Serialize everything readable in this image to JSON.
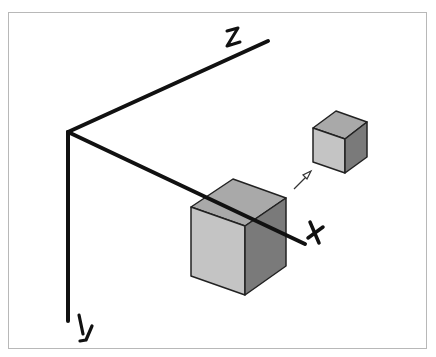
{
  "diagram": {
    "axes": [
      {
        "name": "x",
        "label": "X"
      },
      {
        "name": "y",
        "label": "Y"
      },
      {
        "name": "z",
        "label": "Z"
      }
    ],
    "objects": [
      {
        "name": "large-cube",
        "role": "original"
      },
      {
        "name": "small-cube",
        "role": "translated / scaled"
      }
    ],
    "arrow": {
      "name": "translation-arrow",
      "direction": "toward small cube"
    },
    "colors": {
      "axis": "#111111",
      "cube_front": "#c4c4c4",
      "cube_top": "#a9a9a9",
      "cube_side": "#7a7a7a",
      "cube_edge": "#222222",
      "frame_border": "#b8b8b8"
    }
  }
}
